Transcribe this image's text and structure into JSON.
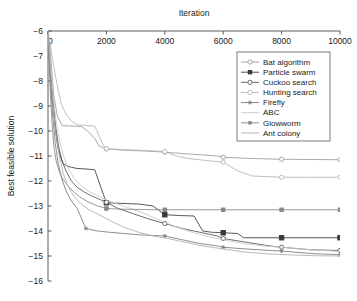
{
  "chart_data": {
    "type": "line",
    "title": "",
    "xlabel": "Iteration",
    "ylabel": "Best feasible solution",
    "xlim": [
      0,
      10000
    ],
    "ylim": [
      -16,
      -6
    ],
    "x_tick_labels": [
      "0",
      "2000",
      "4000",
      "6000",
      "8000",
      "10000"
    ],
    "x_ticks": [
      0,
      2000,
      4000,
      6000,
      8000,
      10000
    ],
    "x_axis_position": "top",
    "y_tick_labels": [
      "-6",
      "-7",
      "-8",
      "-9",
      "-10",
      "-11",
      "-12",
      "-13",
      "-14",
      "-15",
      "-16"
    ],
    "y_ticks": [
      -6,
      -7,
      -8,
      -9,
      -10,
      -11,
      -12,
      -13,
      -14,
      -15,
      -16
    ],
    "grid": false,
    "legend_position": "upper right",
    "legend_entries": [
      "Bat algorithm",
      "Particle swarm",
      "Cuckoo search",
      "Hunting search",
      "Firefly",
      "ABC",
      "Glowworm",
      "Ant colony"
    ],
    "series": [
      {
        "name": "Bat algorithm",
        "color": "#9a9a9a",
        "marker": "open-circle",
        "marker_x": [
          2000,
          4000,
          6000,
          8000,
          10000
        ],
        "x": [
          0,
          60,
          130,
          200,
          320,
          480,
          700,
          900,
          1150,
          1400,
          1600,
          1750,
          2000,
          2400,
          2900,
          3300,
          3700,
          4000,
          4600,
          5200,
          5800,
          6000,
          7000,
          8000,
          9000,
          10000
        ],
        "y": [
          -6.0,
          -6.6,
          -7.6,
          -8.6,
          -9.4,
          -9.78,
          -9.8,
          -9.8,
          -9.82,
          -10.05,
          -10.3,
          -10.6,
          -10.72,
          -10.75,
          -10.78,
          -10.8,
          -10.82,
          -10.85,
          -10.9,
          -10.95,
          -11.0,
          -11.05,
          -11.1,
          -11.13,
          -11.14,
          -11.15
        ]
      },
      {
        "name": "Particle swarm",
        "color": "#3a3a3a",
        "marker": "filled-square",
        "marker_x": [
          2000,
          4000,
          6000,
          8000,
          10000
        ],
        "x": [
          0,
          40,
          90,
          140,
          200,
          260,
          330,
          420,
          520,
          650,
          800,
          1000,
          1300,
          1600,
          1900,
          2000,
          2600,
          3100,
          3300,
          3600,
          4000,
          4500,
          5000,
          5300,
          5600,
          6000,
          6500,
          6700,
          7500,
          8000,
          9000,
          10000
        ],
        "y": [
          -6.0,
          -7.0,
          -8.0,
          -8.6,
          -9.3,
          -10.0,
          -10.6,
          -11.0,
          -11.3,
          -11.4,
          -11.45,
          -11.5,
          -11.52,
          -11.55,
          -12.55,
          -12.87,
          -12.9,
          -12.92,
          -12.95,
          -13.0,
          -13.35,
          -13.38,
          -13.4,
          -14.0,
          -14.05,
          -14.07,
          -14.1,
          -14.27,
          -14.27,
          -14.27,
          -14.27,
          -14.27
        ]
      },
      {
        "name": "Cuckoo search",
        "color": "#555555",
        "marker": "open-circle",
        "marker_x": [
          2000,
          4000,
          6000,
          8000,
          10000
        ],
        "x": [
          0,
          50,
          110,
          180,
          260,
          360,
          480,
          620,
          800,
          1000,
          1250,
          1500,
          1800,
          2000,
          2400,
          2900,
          3400,
          4000,
          4600,
          5200,
          5800,
          6000,
          6800,
          7600,
          8000,
          9000,
          10000
        ],
        "y": [
          -6.0,
          -6.9,
          -7.9,
          -8.9,
          -9.8,
          -10.6,
          -11.2,
          -11.6,
          -12.0,
          -12.25,
          -12.45,
          -12.6,
          -12.75,
          -12.85,
          -13.1,
          -13.3,
          -13.5,
          -13.7,
          -13.9,
          -14.05,
          -14.2,
          -14.3,
          -14.45,
          -14.6,
          -14.65,
          -14.75,
          -14.78
        ]
      },
      {
        "name": "Hunting search",
        "color": "#b5b5b5",
        "marker": "open-circle",
        "marker_x": [
          2000,
          4000,
          6000,
          8000,
          10000
        ],
        "x": [
          0,
          70,
          150,
          240,
          340,
          450,
          600,
          800,
          1000,
          1300,
          1600,
          1900,
          2000,
          2200,
          2500,
          2900,
          3300,
          3700,
          4000,
          4400,
          4800,
          5200,
          5600,
          6000,
          6500,
          7000,
          8000,
          9000,
          10000
        ],
        "y": [
          -6.0,
          -6.5,
          -7.1,
          -7.7,
          -8.3,
          -8.9,
          -9.3,
          -9.6,
          -9.75,
          -9.78,
          -9.8,
          -10.6,
          -10.7,
          -10.72,
          -10.74,
          -10.76,
          -10.78,
          -10.8,
          -10.82,
          -11.0,
          -11.1,
          -11.15,
          -11.2,
          -11.25,
          -11.6,
          -11.8,
          -11.85,
          -11.85,
          -11.85
        ]
      },
      {
        "name": "Firefly",
        "color": "#7a7a7a",
        "marker": "asterisk",
        "marker_x": [
          1300,
          4000,
          6000,
          8000,
          10000
        ],
        "x": [
          0,
          45,
          100,
          170,
          250,
          350,
          470,
          620,
          800,
          1000,
          1300,
          1700,
          2100,
          2600,
          3100,
          3600,
          4000,
          4600,
          5200,
          5800,
          6000,
          6800,
          7600,
          8000,
          9000,
          10000
        ],
        "y": [
          -6.0,
          -7.2,
          -8.4,
          -9.5,
          -10.5,
          -11.3,
          -11.9,
          -12.4,
          -12.8,
          -13.1,
          -13.9,
          -14.0,
          -14.05,
          -14.1,
          -14.15,
          -14.18,
          -14.2,
          -14.35,
          -14.5,
          -14.6,
          -14.65,
          -14.72,
          -14.78,
          -14.8,
          -14.9,
          -14.95
        ]
      },
      {
        "name": "ABC",
        "color": "#c8c8c8",
        "marker": "none",
        "marker_x": [],
        "x": [
          0,
          55,
          120,
          200,
          290,
          400,
          530,
          700,
          900,
          1150,
          1450,
          1800,
          2200,
          2700,
          3200,
          3700,
          4200,
          4800,
          5400,
          6000,
          6700,
          7400,
          8000,
          9000,
          10000
        ],
        "y": [
          -6.0,
          -6.8,
          -7.8,
          -8.8,
          -9.7,
          -10.4,
          -11.0,
          -11.5,
          -11.9,
          -12.2,
          -12.45,
          -12.65,
          -12.85,
          -13.05,
          -13.25,
          -13.5,
          -13.75,
          -14.0,
          -14.2,
          -14.35,
          -14.5,
          -14.6,
          -14.65,
          -14.75,
          -14.82
        ]
      },
      {
        "name": "Glowworm",
        "color": "#868686",
        "marker": "filled-square-small",
        "marker_x": [
          2000,
          4000,
          6000,
          8000,
          10000
        ],
        "x": [
          0,
          40,
          85,
          140,
          200,
          280,
          380,
          500,
          650,
          850,
          1100,
          1400,
          1700,
          2000,
          2600,
          3200,
          3800,
          4000,
          5000,
          6000,
          7000,
          8000,
          9000,
          10000
        ],
        "y": [
          -6.0,
          -7.3,
          -8.6,
          -9.7,
          -10.6,
          -11.2,
          -11.6,
          -11.9,
          -12.15,
          -12.4,
          -12.65,
          -12.85,
          -13.0,
          -13.1,
          -13.13,
          -13.14,
          -13.15,
          -13.15,
          -13.15,
          -13.15,
          -13.15,
          -13.15,
          -13.15,
          -13.15
        ]
      },
      {
        "name": "Ant colony",
        "color": "#aeaeae",
        "marker": "none",
        "marker_x": [],
        "x": [
          0,
          50,
          110,
          190,
          280,
          390,
          520,
          680,
          880,
          1120,
          1400,
          1750,
          2150,
          2600,
          3100,
          3600,
          4100,
          4700,
          5300,
          6000,
          6800,
          7600,
          8400,
          9200,
          10000
        ],
        "y": [
          -6.0,
          -7.0,
          -8.1,
          -9.2,
          -10.2,
          -11.0,
          -11.7,
          -12.2,
          -12.6,
          -12.9,
          -13.15,
          -13.35,
          -13.6,
          -13.85,
          -14.05,
          -14.2,
          -14.3,
          -14.45,
          -14.6,
          -14.72,
          -14.85,
          -14.92,
          -14.96,
          -14.99,
          -15.0
        ]
      }
    ]
  }
}
